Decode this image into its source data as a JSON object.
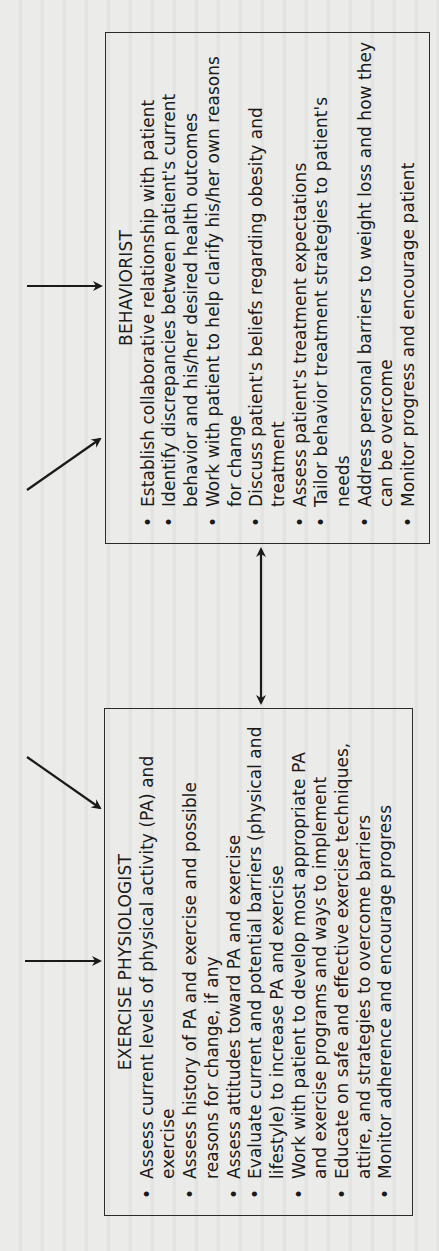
{
  "page": {
    "orientation": "rotated-90-ccw",
    "background": "#ebebe9",
    "line_color": "#1a1a1a"
  },
  "diagram": {
    "behaviorist": {
      "title": "BEHAVIORIST",
      "items": [
        "Establish collaborative relationship with patient",
        "Identify discrepancies between patient's current behavior and his/her desired health outcomes",
        "Work with patient to help clarify his/her own reasons for change",
        "Discuss patient's beliefs regarding obesity and treatment",
        "Assess patient's treatment expectations",
        "Tailor behavior treatment strategies to patient's needs",
        "Address personal barriers to weight loss and how they can be overcome",
        "Monitor progress and encourage patient"
      ],
      "incoming_arrows": [
        "horizontal",
        "diagonal"
      ]
    },
    "exercise_physiologist": {
      "title": "EXERCISE PHYSIOLOGIST",
      "items": [
        "Assess current levels of physical activity (PA) and exercise",
        "Assess history of PA and exercise and possible reasons for change, if any",
        "Assess attitudes toward PA and exercise",
        "Evaluate current and potential barriers (physical and lifestyle) to increase PA and exercise",
        "Work with patient to develop most appropriate PA and exercise programs and ways to implement",
        "Educate on safe and effective exercise techniques, attire, and strategies to overcome barriers",
        "Monitor adherence and encourage progress"
      ],
      "incoming_arrows": [
        "diagonal",
        "horizontal"
      ]
    },
    "connector": {
      "type": "double-headed-arrow",
      "between": [
        "exercise_physiologist",
        "behaviorist"
      ]
    },
    "bullet_char": "•"
  }
}
